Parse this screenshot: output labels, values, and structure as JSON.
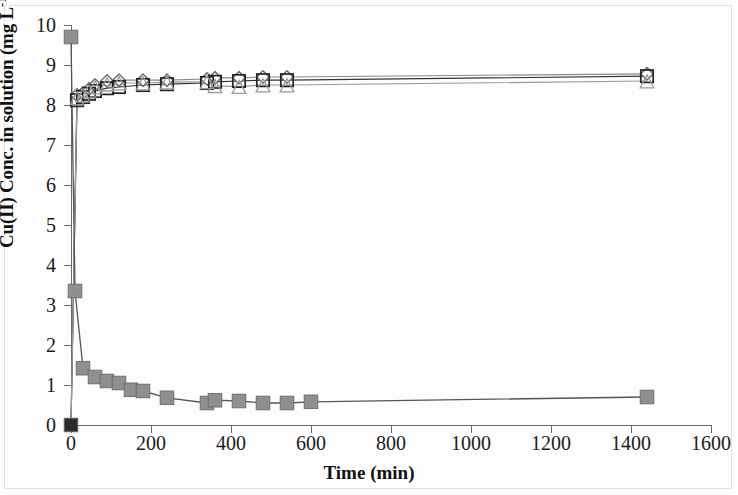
{
  "figure": {
    "kind": "scientific-line-chart",
    "background": "#fdfdfd"
  },
  "axes": {
    "y_title_main": "Cu(II) Conc. in solution (mg L",
    "y_title_sup": "-1",
    "y_title_close": ")",
    "x_title": "Time (min)",
    "y_ticks": [
      "0",
      "1",
      "2",
      "3",
      "4",
      "5",
      "6",
      "7",
      "8",
      "9",
      "10"
    ],
    "x_ticks": [
      "0",
      "200",
      "400",
      "600",
      "800",
      "1000",
      "1200",
      "1400",
      "1600"
    ]
  },
  "chart_data": {
    "type": "line",
    "title": "",
    "xlabel": "Time (min)",
    "ylabel": "Cu(II) Conc. in solution (mg L-1)",
    "xlim": [
      0,
      1600
    ],
    "ylim": [
      0,
      10
    ],
    "xticks": [
      0,
      200,
      400,
      600,
      800,
      1000,
      1200,
      1400,
      1600
    ],
    "yticks": [
      0,
      1,
      2,
      3,
      4,
      5,
      6,
      7,
      8,
      9,
      10
    ],
    "grid": false,
    "legend": "none",
    "series": [
      {
        "name": "Series 1 (open diamond)",
        "marker": "diamond-open",
        "color": "#6f6f6f",
        "line_color": "#8a8a8a",
        "x": [
          0,
          15,
          30,
          45,
          60,
          90,
          120,
          180,
          240,
          340,
          360,
          420,
          480,
          540,
          1440
        ],
        "y": [
          0.0,
          8.25,
          8.3,
          8.4,
          8.5,
          8.6,
          8.62,
          8.62,
          8.62,
          8.65,
          8.68,
          8.68,
          8.7,
          8.7,
          8.78
        ]
      },
      {
        "name": "Series 2 (open square)",
        "marker": "square-open",
        "color": "#242424",
        "line_color": "#333333",
        "x": [
          0,
          15,
          30,
          45,
          60,
          90,
          120,
          180,
          240,
          340,
          360,
          420,
          480,
          540,
          1440
        ],
        "y": [
          0.0,
          8.12,
          8.2,
          8.28,
          8.35,
          8.42,
          8.45,
          8.5,
          8.52,
          8.55,
          8.58,
          8.6,
          8.62,
          8.62,
          8.72
        ]
      },
      {
        "name": "Series 3 (open triangle)",
        "marker": "triangle-open",
        "color": "#9a9a9a",
        "line_color": "#9a9a9a",
        "x": [
          0,
          15,
          30,
          45,
          60,
          90,
          120,
          180,
          240,
          340,
          360,
          420,
          480,
          540,
          1440
        ],
        "y": [
          0.0,
          8.18,
          8.25,
          8.35,
          8.45,
          8.52,
          8.55,
          8.55,
          8.57,
          8.58,
          8.48,
          8.46,
          8.5,
          8.5,
          8.6
        ]
      },
      {
        "name": "Series 4 (filled square)",
        "marker": "square-filled",
        "color": "#8f8f8f",
        "line_color": "#555555",
        "x": [
          0,
          10,
          30,
          60,
          90,
          120,
          150,
          180,
          240,
          340,
          360,
          420,
          480,
          540,
          600,
          1440
        ],
        "y": [
          9.7,
          3.35,
          1.42,
          1.2,
          1.1,
          1.05,
          0.88,
          0.85,
          0.68,
          0.55,
          0.62,
          0.6,
          0.55,
          0.55,
          0.58,
          0.7
        ]
      },
      {
        "name": "Series 5 (origin marker)",
        "marker": "square-filled",
        "color": "#2b2b2b",
        "line_color": "#2b2b2b",
        "x": [
          0
        ],
        "y": [
          0.0
        ]
      }
    ]
  }
}
